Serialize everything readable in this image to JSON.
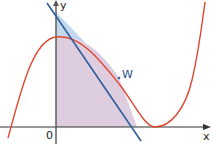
{
  "diagram": {
    "type": "function-graph",
    "axes": {
      "x_label": "x",
      "y_label": "y",
      "origin_label": "0"
    },
    "point_label": "W",
    "elements": [
      {
        "name": "cubic-curve",
        "color": "#e0452e",
        "description": "cubic function with local maximum on the y-axis and a local minimum touching the x-axis"
      },
      {
        "name": "tangent-line",
        "color": "#2f5f9e",
        "description": "tangent line to the curve at point W"
      },
      {
        "name": "region-between-tangent-and-curve",
        "color": "#b9d3ea"
      },
      {
        "name": "region-under-curve",
        "color": "#d9c6dc"
      }
    ],
    "colors": {
      "curve": "#e0452e",
      "tangent": "#2f5f9e",
      "axis": "#333333",
      "fill_blue": "#bcd4eb",
      "fill_purple": "#dccadd"
    }
  }
}
